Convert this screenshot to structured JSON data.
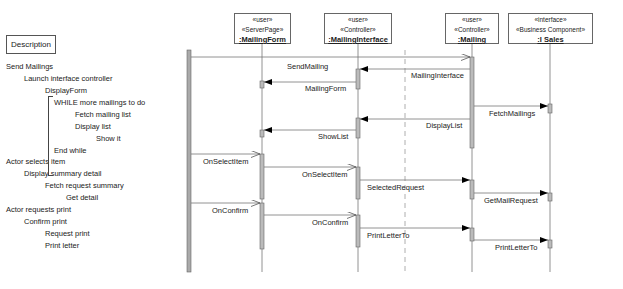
{
  "description": {
    "title": "Description",
    "lines": [
      {
        "text": "Send Mailings",
        "indent": 0
      },
      {
        "text": "Launch interface controller",
        "indent": 1
      },
      {
        "text": "DisplayForm",
        "indent": 2
      },
      {
        "text": "WHILE more mailings to do",
        "indent": 0.6
      },
      {
        "text": "Fetch mailing list",
        "indent": 2
      },
      {
        "text": "Display list",
        "indent": 2
      },
      {
        "text": "Show it",
        "indent": 3
      },
      {
        "text": "End while",
        "indent": 0.6
      },
      {
        "text": "Actor selects item",
        "indent": 0
      },
      {
        "text": "Display summary detail",
        "indent": 1
      },
      {
        "text": "Fetch request summary",
        "indent": 2
      },
      {
        "text": "Get detail",
        "indent": 3
      },
      {
        "text": "Actor requests print",
        "indent": 0
      },
      {
        "text": "Confirm print",
        "indent": 1
      },
      {
        "text": "Request print",
        "indent": 2
      },
      {
        "text": "Print letter",
        "indent": 2
      }
    ]
  },
  "lifelines": [
    {
      "stereo1": "«user»",
      "stereo2": "«ServerPage»",
      "name": ":MailingForm"
    },
    {
      "stereo1": "«user»",
      "stereo2": "«Controller»",
      "name": ":MailingInterface"
    },
    {
      "stereo1": "«user»",
      "stereo2": "«Controller»",
      "name": ":Mailing"
    },
    {
      "stereo1": "«interface»",
      "stereo2": "«Business Component»",
      "name": ":I Sales"
    }
  ],
  "messages": [
    {
      "label": "SendMailing"
    },
    {
      "label": "MailingInterface"
    },
    {
      "label": "MailingForm"
    },
    {
      "label": "FetchMailings"
    },
    {
      "label": "DisplayList"
    },
    {
      "label": "ShowList"
    },
    {
      "label": "OnSelectItem"
    },
    {
      "label": "OnSelectItem"
    },
    {
      "label": "SelectedRequest"
    },
    {
      "label": "GetMailRequest"
    },
    {
      "label": "OnConfirm"
    },
    {
      "label": "OnConfirm"
    },
    {
      "label": "PrintLetterTo"
    },
    {
      "label": "PrintLetterTo"
    }
  ]
}
